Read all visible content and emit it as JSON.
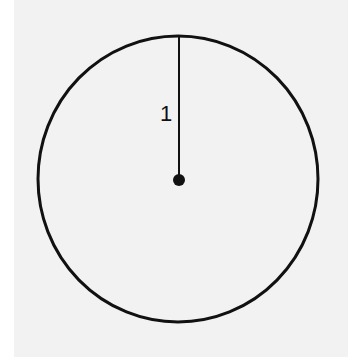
{
  "diagram": {
    "radius_label": "1",
    "colors": {
      "background": "#f2f2f2",
      "stroke": "#111111"
    },
    "circle": {
      "cx": 178,
      "cy": 179,
      "rx": 140,
      "ry": 143
    },
    "radius_line": {
      "x1": 179,
      "y1": 36,
      "x2": 179,
      "y2": 179
    },
    "center_point": {
      "cx": 179,
      "cy": 180,
      "r": 6
    }
  }
}
